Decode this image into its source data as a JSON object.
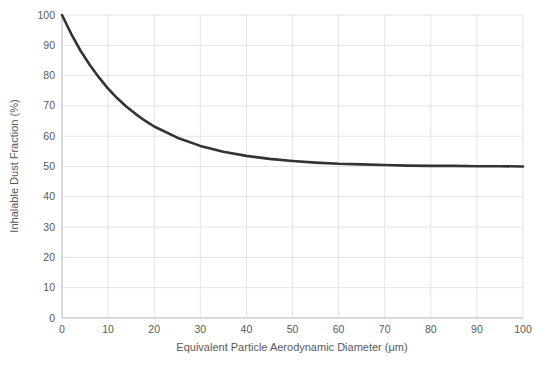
{
  "chart_data": {
    "type": "line",
    "title": "",
    "xlabel": "Equivalent Particle Aerodynamic Diameter (μm)",
    "ylabel": "Inhalable Dust Fraction (%)",
    "xlim": [
      0,
      100
    ],
    "ylim": [
      0,
      100
    ],
    "xticks": [
      0,
      10,
      20,
      30,
      40,
      50,
      60,
      70,
      80,
      90,
      100
    ],
    "yticks": [
      0,
      10,
      20,
      30,
      40,
      50,
      60,
      70,
      80,
      90,
      100
    ],
    "grid": true,
    "legend": "none",
    "series": [
      {
        "name": "Inhalable dust fraction curve",
        "x": [
          0,
          2,
          4,
          6,
          8,
          10,
          12,
          14,
          16,
          18,
          20,
          25,
          30,
          35,
          40,
          45,
          50,
          55,
          60,
          65,
          70,
          75,
          80,
          85,
          90,
          95,
          100
        ],
        "y": [
          100,
          93.8,
          88.3,
          83.6,
          79.4,
          75.7,
          72.5,
          69.7,
          67.3,
          65.1,
          63.2,
          59.5,
          56.8,
          54.9,
          53.5,
          52.5,
          51.8,
          51.3,
          50.9,
          50.7,
          50.5,
          50.3,
          50.2,
          50.2,
          50.1,
          50.1,
          50.0
        ],
        "color": "#333333",
        "width": 2.6
      }
    ],
    "colors": {
      "background": "#ffffff",
      "gridline": "#e4e4e4",
      "axis_line": "#b5b5b5",
      "tick_label": "#595959",
      "axis_title": "#595959"
    }
  }
}
